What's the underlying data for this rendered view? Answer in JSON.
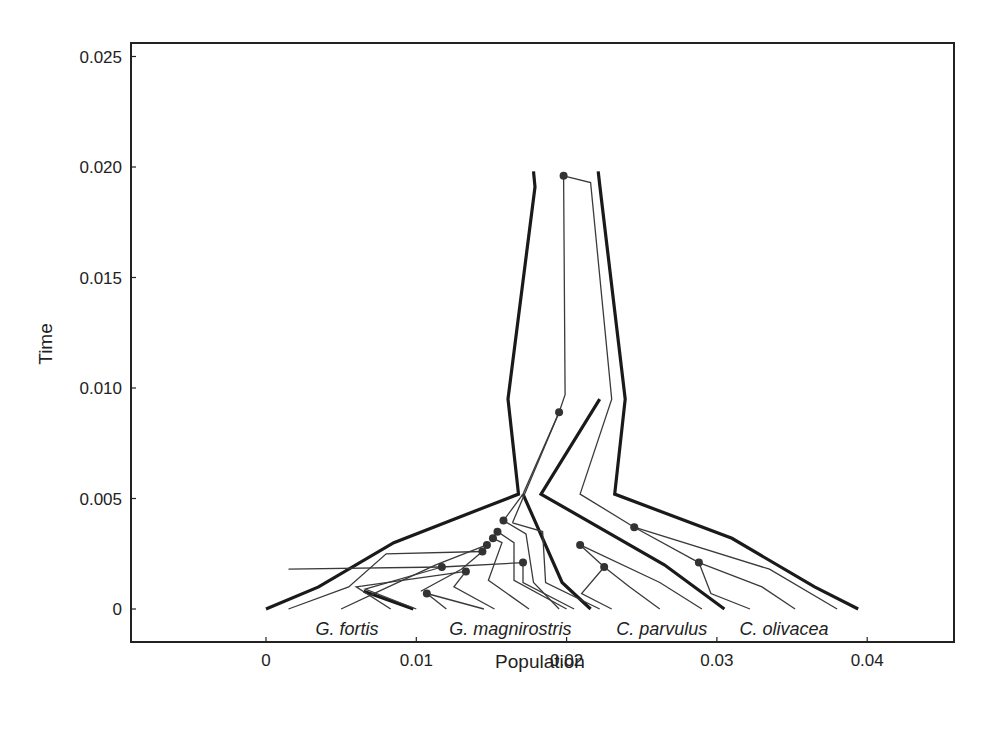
{
  "chart_data": {
    "type": "line",
    "title": "",
    "xlabel": "Population",
    "ylabel": "Time",
    "xlim": [
      -0.0088,
      0.0458
    ],
    "ylim": [
      -0.0015,
      0.0256
    ],
    "xticks": [
      0,
      0.01,
      0.02,
      0.03,
      0.04
    ],
    "xtick_labels": [
      "0",
      "0.01",
      "0.02",
      "0.03",
      "0.04"
    ],
    "yticks": [
      0,
      0.005,
      0.01,
      0.015,
      0.02,
      0.025
    ],
    "ytick_labels": [
      "0",
      "0.005",
      "0.010",
      "0.015",
      "0.020",
      "0.025"
    ],
    "grid": false,
    "legend": null,
    "species_labels": [
      {
        "text": "G. fortis",
        "x": 0.0033,
        "y": -0.0009
      },
      {
        "text": "G. magnirostris",
        "x": 0.0122,
        "y": -0.0009
      },
      {
        "text": "C. parvulus",
        "x": 0.0233,
        "y": -0.0009
      },
      {
        "text": "C. olivacea",
        "x": 0.0315,
        "y": -0.0009
      }
    ],
    "population_boundaries": [
      {
        "name": "outer-left",
        "points": [
          [
            0.0178,
            0.0198
          ],
          [
            0.0179,
            0.0191
          ],
          [
            0.0161,
            0.0095
          ],
          [
            0.0168,
            0.0052
          ],
          [
            0.0085,
            0.003
          ],
          [
            0.0035,
            0.001
          ],
          [
            0.0,
            0.0
          ]
        ]
      },
      {
        "name": "inner-split",
        "points": [
          [
            0.0171,
            0.0052
          ],
          [
            0.0197,
            0.0012
          ],
          [
            0.0216,
            0.0
          ]
        ]
      },
      {
        "name": "parvulus-branch",
        "points": [
          [
            0.0222,
            0.0095
          ],
          [
            0.0183,
            0.0052
          ],
          [
            0.0265,
            0.002
          ],
          [
            0.0305,
            0.0
          ]
        ]
      },
      {
        "name": "outer-right",
        "points": [
          [
            0.0221,
            0.0198
          ],
          [
            0.0222,
            0.0192
          ],
          [
            0.0239,
            0.0095
          ],
          [
            0.0232,
            0.0052
          ],
          [
            0.031,
            0.0032
          ],
          [
            0.0365,
            0.001
          ],
          [
            0.0394,
            0.0
          ]
        ]
      },
      {
        "name": "fortis-short",
        "points": [
          [
            0.0065,
            0.0008
          ],
          [
            0.0098,
            0.0
          ]
        ]
      }
    ],
    "gene_lineages": [
      {
        "points": [
          [
            0.0198,
            0.0196
          ],
          [
            0.0199,
            0.0097
          ],
          [
            0.0195,
            0.0089
          ]
        ]
      },
      {
        "points": [
          [
            0.0198,
            0.0196
          ],
          [
            0.0216,
            0.0193
          ],
          [
            0.023,
            0.0095
          ],
          [
            0.0209,
            0.0052
          ],
          [
            0.0245,
            0.0037
          ]
        ]
      },
      {
        "points": [
          [
            0.0195,
            0.0089
          ],
          [
            0.0164,
            0.0039
          ]
        ]
      },
      {
        "points": [
          [
            0.0195,
            0.0089
          ],
          [
            0.0171,
            0.0052
          ],
          [
            0.0158,
            0.004
          ]
        ]
      },
      {
        "points": [
          [
            0.0158,
            0.004
          ],
          [
            0.0173,
            0.0034
          ],
          [
            0.0178,
            0.0012
          ],
          [
            0.0195,
            0.0
          ]
        ]
      },
      {
        "points": [
          [
            0.0164,
            0.0039
          ],
          [
            0.0184,
            0.0035
          ],
          [
            0.0186,
            0.0012
          ],
          [
            0.0222,
            0.0
          ]
        ]
      },
      {
        "points": [
          [
            0.0154,
            0.0035
          ],
          [
            0.0165,
            0.003
          ],
          [
            0.0165,
            0.0013
          ],
          [
            0.02,
            0.0
          ]
        ]
      },
      {
        "points": [
          [
            0.0151,
            0.0032
          ],
          [
            0.0157,
            0.003
          ],
          [
            0.0148,
            0.0013
          ],
          [
            0.0175,
            0.0
          ]
        ]
      },
      {
        "points": [
          [
            0.0147,
            0.0029
          ],
          [
            0.0113,
            0.002
          ],
          [
            0.0075,
            0.0008
          ],
          [
            0.005,
            0.0
          ]
        ]
      },
      {
        "points": [
          [
            0.0144,
            0.0026
          ],
          [
            0.008,
            0.0025
          ],
          [
            0.0055,
            0.001
          ],
          [
            0.0015,
            0.0
          ]
        ]
      },
      {
        "points": [
          [
            0.0144,
            0.0026
          ],
          [
            0.013,
            0.0018
          ],
          [
            0.0103,
            0.0008
          ]
        ]
      },
      {
        "points": [
          [
            0.0117,
            0.0019
          ],
          [
            0.0015,
            0.0018
          ]
        ]
      },
      {
        "points": [
          [
            0.0117,
            0.0019
          ],
          [
            0.0171,
            0.0021
          ],
          [
            0.0171,
            0.0012
          ],
          [
            0.0205,
            0.0
          ]
        ]
      },
      {
        "points": [
          [
            0.0117,
            0.0019
          ],
          [
            0.0066,
            0.0009
          ],
          [
            0.01,
            0.0
          ]
        ]
      },
      {
        "points": [
          [
            0.0133,
            0.0017
          ],
          [
            0.006,
            0.001
          ],
          [
            0.0083,
            0.0
          ]
        ]
      },
      {
        "points": [
          [
            0.0133,
            0.0017
          ],
          [
            0.0125,
            0.001
          ],
          [
            0.0152,
            0.0
          ]
        ]
      },
      {
        "points": [
          [
            0.0107,
            0.0007
          ],
          [
            0.012,
            0.0
          ]
        ]
      },
      {
        "points": [
          [
            0.0107,
            0.0007
          ],
          [
            0.0145,
            0.0
          ]
        ]
      },
      {
        "points": [
          [
            0.0209,
            0.0029
          ],
          [
            0.0262,
            0.0012
          ],
          [
            0.029,
            0.0
          ]
        ]
      },
      {
        "points": [
          [
            0.0209,
            0.0029
          ],
          [
            0.0225,
            0.0019
          ]
        ]
      },
      {
        "points": [
          [
            0.0225,
            0.0019
          ],
          [
            0.021,
            0.0007
          ],
          [
            0.023,
            0.0
          ]
        ]
      },
      {
        "points": [
          [
            0.0225,
            0.0019
          ],
          [
            0.0242,
            0.001
          ],
          [
            0.0262,
            0.0
          ]
        ]
      },
      {
        "points": [
          [
            0.0245,
            0.0037
          ],
          [
            0.0335,
            0.0018
          ],
          [
            0.038,
            0.0
          ]
        ]
      },
      {
        "points": [
          [
            0.0245,
            0.0037
          ],
          [
            0.0288,
            0.0021
          ]
        ]
      },
      {
        "points": [
          [
            0.0288,
            0.0021
          ],
          [
            0.0296,
            0.0007
          ],
          [
            0.0322,
            0.0
          ]
        ]
      },
      {
        "points": [
          [
            0.0288,
            0.0021
          ],
          [
            0.033,
            0.001
          ],
          [
            0.0352,
            0.0
          ]
        ]
      }
    ],
    "coalescent_nodes": [
      [
        0.0198,
        0.0196
      ],
      [
        0.0195,
        0.0089
      ],
      [
        0.0158,
        0.004
      ],
      [
        0.0154,
        0.0035
      ],
      [
        0.0151,
        0.0032
      ],
      [
        0.0147,
        0.0029
      ],
      [
        0.0144,
        0.0026
      ],
      [
        0.0117,
        0.0019
      ],
      [
        0.0133,
        0.0017
      ],
      [
        0.0171,
        0.0021
      ],
      [
        0.0107,
        0.0007
      ],
      [
        0.0209,
        0.0029
      ],
      [
        0.0225,
        0.0019
      ],
      [
        0.0245,
        0.0037
      ],
      [
        0.0288,
        0.0021
      ]
    ]
  },
  "styles": {
    "line_color": "#1a1a1a",
    "node_color": "#333333",
    "frame_color": "#222222"
  }
}
